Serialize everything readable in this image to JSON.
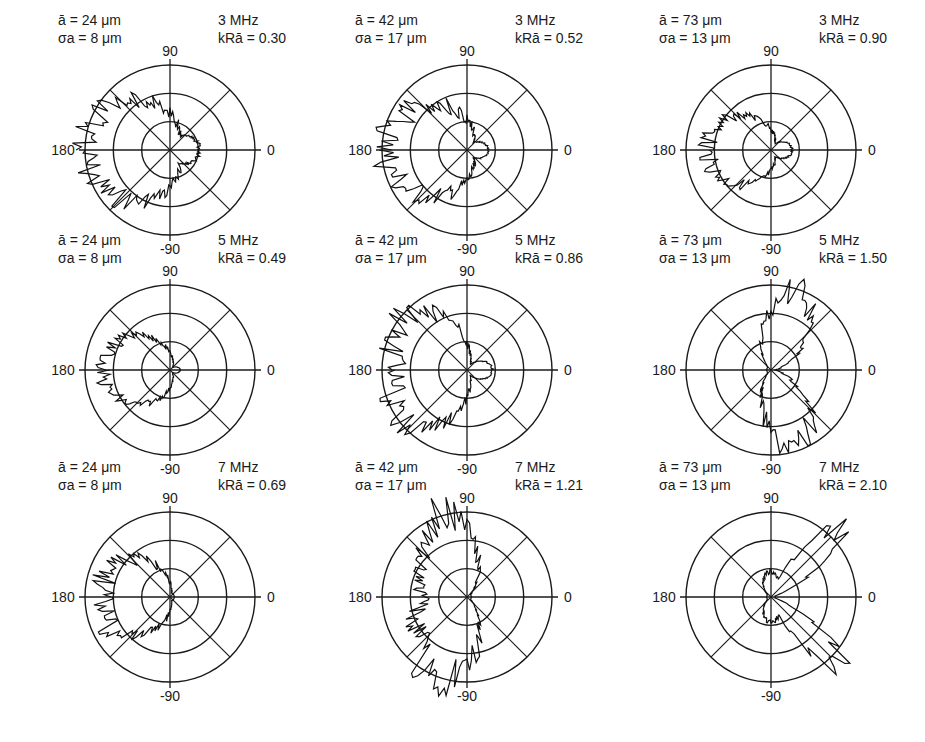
{
  "figure": {
    "axis_labels": {
      "top": "90",
      "left": "180",
      "right": "0",
      "bottom": "-90"
    }
  },
  "panels": [
    {
      "mean_size": "ā = 24 μm",
      "sigma": "σa = 8 μm",
      "freq": "3 MHz",
      "kr": "kRā = 0.30"
    },
    {
      "mean_size": "ā = 42 μm",
      "sigma": "σa = 17 μm",
      "freq": "3 MHz",
      "kr": "kRā = 0.52"
    },
    {
      "mean_size": "ā = 73 μm",
      "sigma": "σa = 13 μm",
      "freq": "3 MHz",
      "kr": "kRā = 0.90"
    },
    {
      "mean_size": "ā = 24 μm",
      "sigma": "σa = 8 μm",
      "freq": "5 MHz",
      "kr": "kRā = 0.49"
    },
    {
      "mean_size": "ā = 42 μm",
      "sigma": "σa = 17 μm",
      "freq": "5 MHz",
      "kr": "kRā = 0.86"
    },
    {
      "mean_size": "ā = 73 μm",
      "sigma": "σa = 13 μm",
      "freq": "5 MHz",
      "kr": "kRā = 1.50"
    },
    {
      "mean_size": "ā = 24 μm",
      "sigma": "σa = 8 μm",
      "freq": "7 MHz",
      "kr": "kRā = 0.69"
    },
    {
      "mean_size": "ā = 42 μm",
      "sigma": "σa = 17 μm",
      "freq": "7 MHz",
      "kr": "kRā = 1.21"
    },
    {
      "mean_size": "ā = 73 μm",
      "sigma": "σa = 13 μm",
      "freq": "7 MHz",
      "kr": "kRā = 2.10"
    }
  ],
  "chart_data": [
    {
      "type": "polar",
      "title": "ā=24μm, σa=8μm, 3 MHz, kRā=0.30",
      "angular_ticks": [
        90,
        0,
        -90,
        180
      ],
      "rings": 3,
      "pattern": "backscatter lobe toward 180°, broad; small lobe toward 0°"
    },
    {
      "type": "polar",
      "title": "ā=42μm, σa=17μm, 3 MHz, kRā=0.52",
      "angular_ticks": [
        90,
        0,
        -90,
        180
      ],
      "rings": 3,
      "pattern": "lobe toward 180° reaching near outer ring"
    },
    {
      "type": "polar",
      "title": "ā=73μm, σa=13μm, 3 MHz, kRā=0.90",
      "angular_ticks": [
        90,
        0,
        -90,
        180
      ],
      "rings": 3,
      "pattern": "lobe toward 180° at ~middle ring"
    },
    {
      "type": "polar",
      "title": "ā=24μm, σa=8μm, 5 MHz, kRā=0.49",
      "angular_ticks": [
        90,
        0,
        -90,
        180
      ],
      "rings": 3,
      "pattern": "circular lobe toward 180°"
    },
    {
      "type": "polar",
      "title": "ā=42μm, σa=17μm, 5 MHz, kRā=0.86",
      "angular_ticks": [
        90,
        0,
        -90,
        180
      ],
      "rings": 3,
      "pattern": "lobe toward 180° beyond outer ring with spikes"
    },
    {
      "type": "polar",
      "title": "ā=73μm, σa=13μm, 5 MHz, kRā=1.50",
      "angular_ticks": [
        90,
        0,
        -90,
        180
      ],
      "rings": 3,
      "pattern": "two lobes toward ~70° and ~-70°"
    },
    {
      "type": "polar",
      "title": "ā=24μm, σa=8μm, 7 MHz, kRā=0.69",
      "angular_ticks": [
        90,
        0,
        -90,
        180
      ],
      "rings": 3,
      "pattern": "lobe toward 180°"
    },
    {
      "type": "polar",
      "title": "ā=42μm, σa=17μm, 7 MHz, kRā=1.21",
      "angular_ticks": [
        90,
        0,
        -90,
        180
      ],
      "rings": 3,
      "pattern": "two lobes toward ~110° and ~-110° reaching outer ring"
    },
    {
      "type": "polar",
      "title": "ā=73μm, σa=13μm, 7 MHz, kRā=2.10",
      "angular_ticks": [
        90,
        0,
        -90,
        180
      ],
      "rings": 3,
      "pattern": "narrow lobes along 45° and -45° diagonals"
    }
  ]
}
